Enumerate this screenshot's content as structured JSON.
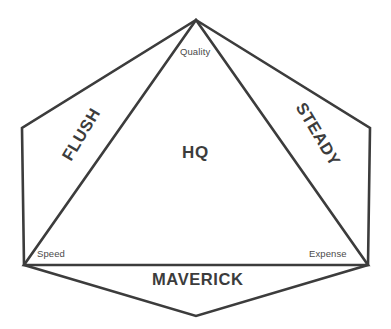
{
  "diagram": {
    "type": "hexagon-with-inscribed-triangle",
    "center_label": "HQ",
    "vertex_labels": {
      "top": "Quality",
      "bottom_left": "Speed",
      "bottom_right": "Expense"
    },
    "region_labels": {
      "left": "FLUSH",
      "right": "STEADY",
      "bottom": "MAVERICK"
    },
    "colors": {
      "stroke": "#3c3c3c",
      "background": "#ffffff",
      "text": "#3c3c3c",
      "vertex_text": "#4a4a4a"
    },
    "geometry": {
      "hexagon_points": "196,20 370,128 368,265 196,316 24,265 22,128",
      "triangle_points": "196,20 368,265 24,265"
    }
  }
}
